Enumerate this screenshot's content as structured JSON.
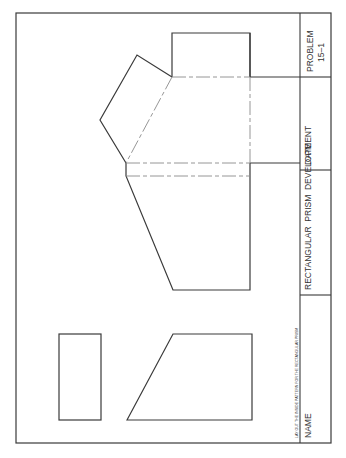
{
  "title_block": {
    "problem_label": "PROBLEM",
    "problem_number": "15–1",
    "date_label": "DATE",
    "title": "RECTANGULAR  PRISM  DEVELOPMENT",
    "name_label": "NAME",
    "instruction": "LAY OUT THE INSIDE PATTERN FOR THE RECTANGULAR PRISM"
  },
  "colors": {
    "line": "#3a3a3a",
    "fold_line": "#8a8a8a",
    "background": "#ffffff"
  },
  "drawing": {
    "views": [
      "top-view-rectangle",
      "front-view-trapezoid"
    ],
    "pattern": "rectangular-prism-development"
  }
}
